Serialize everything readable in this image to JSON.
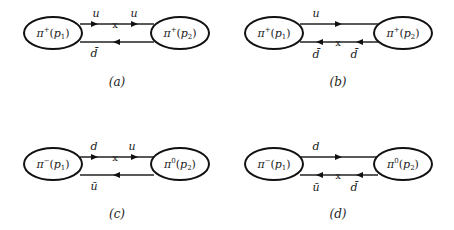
{
  "panels": [
    {
      "id": "a",
      "caption": "(a)",
      "left_meson": {
        "name": "π",
        "charge": "+",
        "momentum": "p",
        "index": "1"
      },
      "right_meson": {
        "name": "π",
        "charge": "+",
        "momentum": "p",
        "index": "2"
      },
      "top_line": {
        "labels": [
          "u",
          "u"
        ],
        "direction": "right",
        "insertion": true
      },
      "bottom_line": {
        "labels": [
          "d̄"
        ],
        "direction": "left",
        "insertion": false
      }
    },
    {
      "id": "b",
      "caption": "(b)",
      "left_meson": {
        "name": "π",
        "charge": "+",
        "momentum": "p",
        "index": "1"
      },
      "right_meson": {
        "name": "π",
        "charge": "+",
        "momentum": "p",
        "index": "2"
      },
      "top_line": {
        "labels": [
          "u"
        ],
        "direction": "right",
        "insertion": false
      },
      "bottom_line": {
        "labels": [
          "d̄",
          "d̄"
        ],
        "direction": "left",
        "insertion": true
      }
    },
    {
      "id": "c",
      "caption": "(c)",
      "left_meson": {
        "name": "π",
        "charge": "−",
        "momentum": "p",
        "index": "1"
      },
      "right_meson": {
        "name": "π",
        "charge": "0",
        "momentum": "p",
        "index": "2"
      },
      "top_line": {
        "labels": [
          "d",
          "u"
        ],
        "direction": "right",
        "insertion": true
      },
      "bottom_line": {
        "labels": [
          "ū"
        ],
        "direction": "left",
        "insertion": false
      }
    },
    {
      "id": "d",
      "caption": "(d)",
      "left_meson": {
        "name": "π",
        "charge": "−",
        "momentum": "p",
        "index": "1"
      },
      "right_meson": {
        "name": "π",
        "charge": "0",
        "momentum": "p",
        "index": "2"
      },
      "top_line": {
        "labels": [
          "d"
        ],
        "direction": "right",
        "insertion": false
      },
      "bottom_line": {
        "labels": [
          "ū",
          "d̄"
        ],
        "direction": "left",
        "insertion": true
      }
    }
  ],
  "insertion_mark": "x"
}
